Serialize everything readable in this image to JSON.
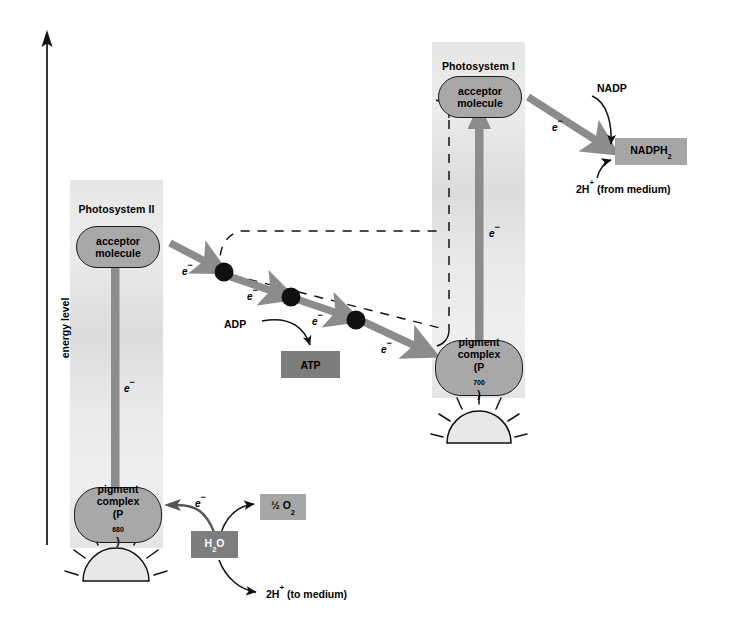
{
  "figure": {
    "axis": {
      "label": "energy level"
    },
    "photosystem_ii": {
      "title": "Photosystem II",
      "acceptor": {
        "line1": "acceptor",
        "line2": "molecule"
      },
      "pigment": {
        "line1": "pigment",
        "line2": "complex",
        "line3_prefix": "(P",
        "line3_sub": "680",
        "line3_suffix": ")"
      },
      "electron_label": "e⁻"
    },
    "photosystem_i": {
      "title": "Photosystem I",
      "acceptor": {
        "line1": "acceptor",
        "line2": "molecule"
      },
      "pigment": {
        "line1": "pigment",
        "line2": "complex",
        "line3_prefix": "(P",
        "line3_sub": "700",
        "line3_suffix": ")"
      },
      "electron_label": "e⁻"
    },
    "transport_chain": {
      "electron_labels": [
        "e⁻",
        "e⁻",
        "e⁻",
        "e⁻"
      ],
      "carrier_count": 3
    },
    "atp_branch": {
      "reactant": "ADP",
      "product": "ATP"
    },
    "nadp_branch": {
      "electron_label": "e⁻",
      "reactant": "NADP",
      "product_prefix": "NADPH",
      "product_sub": "2",
      "proton_source": "2H⁺  (from medium)"
    },
    "water_branch": {
      "water_prefix": "H",
      "water_sub": "2",
      "water_suffix": "O",
      "oxygen_prefix": "½ O",
      "oxygen_sub": "2",
      "electron_label": "e⁻",
      "proton_release": "2H⁺  (to medium)"
    },
    "colors": {
      "capsule_fill": "#a8a8a8",
      "capsule_stroke": "#1c1c1c",
      "panel_gradient_light": "#ececec",
      "panel_gradient_dark": "#dcdcdc",
      "thick_arrow": "#8c8c8c",
      "dark_box": "#7d7d7d",
      "mid_box": "#a6a6a6",
      "carrier_dot": "#101010",
      "axis_line": "#111111",
      "sun_fill": "#e2e2e2"
    }
  }
}
